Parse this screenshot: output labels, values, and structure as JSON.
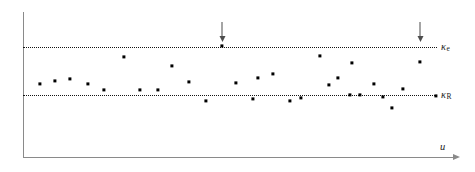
{
  "figure": {
    "width": 475,
    "height": 172,
    "background": "#ffffff",
    "point_color": "#000000",
    "axis_color": "#8a8a8a",
    "reference_line_color": "#141414",
    "arrow_color": "#4d4d4d"
  },
  "chart_data": {
    "type": "scatter",
    "title": "",
    "subtitle": "",
    "xlabel": "u",
    "ylabel": "",
    "grid": false,
    "legend": null,
    "xlim": [
      0,
      1
    ],
    "ylim": [
      0,
      1
    ],
    "axis_ticks": {
      "x": [],
      "y": []
    },
    "reference_lines": [
      {
        "name": "kappa_e",
        "label": "κ",
        "label_subscript": "e",
        "label_full": "κ_e",
        "style": "dotted",
        "orientation": "horizontal",
        "y_pixel": 46.5,
        "y_value": 1.0
      },
      {
        "name": "kappa_R",
        "label": "κ",
        "label_subscript": "R",
        "label_full": "κ_R",
        "style": "dotted",
        "orientation": "horizontal",
        "y_pixel": 94.5,
        "y_value": 0.0
      }
    ],
    "annotations": [
      {
        "name": "arrow-marker-1",
        "glyph": "down-arrow",
        "x_pixel": 222,
        "y_top_pixel": 22,
        "marks_point_index": 13
      },
      {
        "name": "arrow-marker-2",
        "glyph": "down-arrow",
        "x_pixel": 420,
        "y_top_pixel": 22,
        "marks_point_index": 29
      }
    ],
    "points_pixel": [
      [
        40,
        84
      ],
      [
        55,
        81
      ],
      [
        70,
        79
      ],
      [
        88,
        84
      ],
      [
        104,
        90
      ],
      [
        124,
        57
      ],
      [
        140,
        90
      ],
      [
        158,
        90
      ],
      [
        172,
        66
      ],
      [
        189,
        82
      ],
      [
        206,
        101
      ],
      [
        222,
        46
      ],
      [
        236,
        83
      ],
      [
        253,
        99
      ],
      [
        258,
        78
      ],
      [
        273,
        74
      ],
      [
        290,
        101
      ],
      [
        301,
        98
      ],
      [
        320,
        56
      ],
      [
        329,
        85
      ],
      [
        338,
        78
      ],
      [
        350,
        95
      ],
      [
        352,
        63
      ],
      [
        360,
        95
      ],
      [
        374,
        84
      ],
      [
        383,
        97
      ],
      [
        392,
        108
      ],
      [
        403,
        89
      ],
      [
        420,
        62
      ],
      [
        436,
        96
      ]
    ],
    "points_data": [
      {
        "x": 0.041,
        "y": 0.219
      },
      {
        "x": 0.077,
        "y": 0.281
      },
      {
        "x": 0.114,
        "y": 0.323
      },
      {
        "x": 0.157,
        "y": 0.219
      },
      {
        "x": 0.196,
        "y": 0.094
      },
      {
        "x": 0.245,
        "y": 0.781
      },
      {
        "x": 0.283,
        "y": 0.094
      },
      {
        "x": 0.327,
        "y": 0.094
      },
      {
        "x": 0.361,
        "y": 0.594
      },
      {
        "x": 0.402,
        "y": 0.26
      },
      {
        "x": 0.443,
        "y": -0.135
      },
      {
        "x": 0.482,
        "y": 1.01
      },
      {
        "x": 0.516,
        "y": 0.24
      },
      {
        "x": 0.557,
        "y": -0.094
      },
      {
        "x": 0.569,
        "y": 0.344
      },
      {
        "x": 0.606,
        "y": 0.427
      },
      {
        "x": 0.647,
        "y": -0.135
      },
      {
        "x": 0.673,
        "y": -0.073
      },
      {
        "x": 0.719,
        "y": 0.802
      },
      {
        "x": 0.741,
        "y": 0.198
      },
      {
        "x": 0.763,
        "y": 0.344
      },
      {
        "x": 0.792,
        "y": -0.01
      },
      {
        "x": 0.797,
        "y": 0.656
      },
      {
        "x": 0.816,
        "y": -0.01
      },
      {
        "x": 0.85,
        "y": 0.219
      },
      {
        "x": 0.872,
        "y": -0.052
      },
      {
        "x": 0.894,
        "y": -0.281
      },
      {
        "x": 0.92,
        "y": 0.115
      },
      {
        "x": 0.961,
        "y": 0.677
      },
      {
        "x": 1.0,
        "y": -0.031
      }
    ],
    "n_points": 30
  },
  "labels": {
    "kappa_e_base": "κ",
    "kappa_e_sub": "e",
    "kappa_R_base": "κ",
    "kappa_R_sub": "R",
    "x_axis": "u"
  }
}
